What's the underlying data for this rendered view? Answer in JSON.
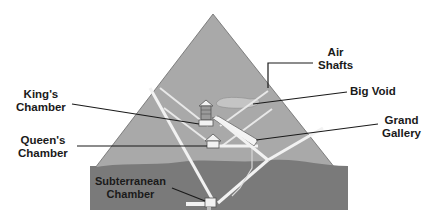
{
  "diagram": {
    "colors": {
      "pyramid": "#a9a9a9",
      "ground": "#7a7a7a",
      "passages": "#f2f2f2",
      "void": "#c4c4c4",
      "lines": "#1a1a1a"
    },
    "labels": {
      "air_shafts_1": "Air",
      "air_shafts_2": "Shafts",
      "big_void": "Big Void",
      "kings_1": "King's",
      "kings_2": "Chamber",
      "queens_1": "Queen's",
      "queens_2": "Chamber",
      "grand_1": "Grand",
      "grand_2": "Gallery",
      "subterranean_1": "Subterranean",
      "subterranean_2": "Chamber"
    }
  }
}
